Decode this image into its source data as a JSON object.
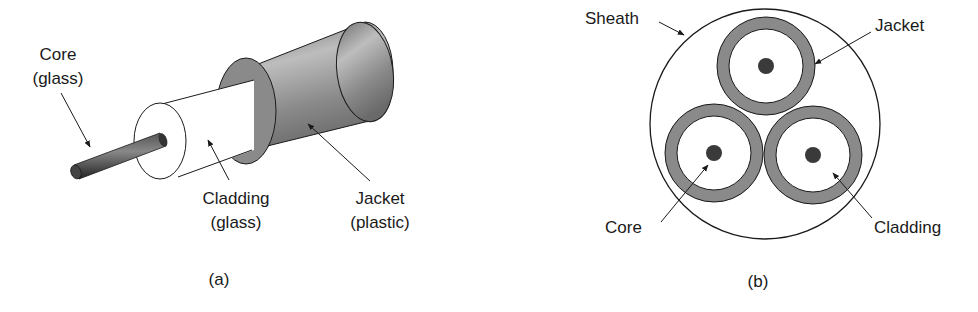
{
  "panel_a": {
    "caption": "(a)",
    "labels": {
      "core_line1": "Core",
      "core_line2": "(glass)",
      "cladding_line1": "Cladding",
      "cladding_line2": "(glass)",
      "jacket_line1": "Jacket",
      "jacket_line2": "(plastic)"
    }
  },
  "panel_b": {
    "caption": "(b)",
    "labels": {
      "sheath": "Sheath",
      "jacket": "Jacket",
      "core": "Core",
      "cladding": "Cladding"
    }
  },
  "colors": {
    "jacket_gray": "#8a8a8a",
    "core_dark": "#3a3a3a",
    "line": "#1a1a1a"
  }
}
